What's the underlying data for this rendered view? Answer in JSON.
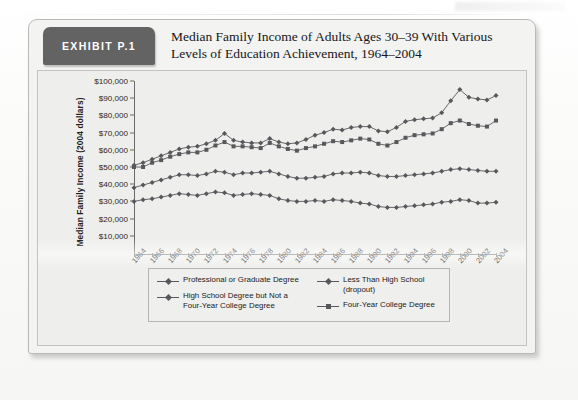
{
  "exhibit": {
    "tag": "EXHIBIT P.1",
    "title_line1": "Median Family Income of Adults Ages 30–39 With Various",
    "title_line2": "Levels of Education Achievement, 1964–2004"
  },
  "chart_data": {
    "type": "line",
    "title": "Median Family Income of Adults Ages 30–39 With Various Levels of Education Achievement, 1964–2004",
    "xlabel": "Year",
    "ylabel": "Median Family Income (2004 dollars)",
    "grid": false,
    "legend_position": "bottom",
    "ylim": [
      0,
      100000
    ],
    "yticks": [
      "$10,000",
      "$20,000",
      "$30,000",
      "$40,000",
      "$50,000",
      "$60,000",
      "$70,000",
      "$80,000",
      "$90,000",
      "$100,000"
    ],
    "ytick_values": [
      10000,
      20000,
      30000,
      40000,
      50000,
      60000,
      70000,
      80000,
      90000,
      100000
    ],
    "xlim": [
      1964,
      2004
    ],
    "xticks": [
      "1964",
      "1966",
      "1968",
      "1970",
      "1972",
      "1974",
      "1976",
      "1978",
      "1980",
      "1982",
      "1984",
      "1986",
      "1988",
      "1990",
      "1992",
      "1994",
      "1996",
      "1998",
      "2000",
      "2002",
      "2004"
    ],
    "x": [
      1964,
      1965,
      1966,
      1967,
      1968,
      1969,
      1970,
      1971,
      1972,
      1973,
      1974,
      1975,
      1976,
      1977,
      1978,
      1979,
      1980,
      1981,
      1982,
      1983,
      1984,
      1985,
      1986,
      1987,
      1988,
      1989,
      1990,
      1991,
      1992,
      1993,
      1994,
      1995,
      1996,
      1997,
      1998,
      1999,
      2000,
      2001,
      2002,
      2003,
      2004
    ],
    "series": [
      {
        "name": "Professional or Graduate Degree",
        "marker": "diamond",
        "color": "#58585c",
        "values": [
          51000,
          52500,
          54500,
          56500,
          58500,
          60500,
          61500,
          62000,
          63500,
          65500,
          69500,
          65500,
          64500,
          64000,
          64000,
          66500,
          64500,
          63500,
          64000,
          66000,
          68500,
          70000,
          72000,
          71500,
          73000,
          73500,
          73500,
          71000,
          70500,
          73000,
          76500,
          77500,
          78000,
          78500,
          81500,
          88500,
          95000,
          90500,
          89500,
          89000,
          91500
        ]
      },
      {
        "name": "Less Than High School (dropout)",
        "marker": "diamond",
        "color": "#58585c",
        "values": [
          30000,
          31000,
          31500,
          32500,
          33500,
          34500,
          34000,
          33500,
          34500,
          35500,
          35000,
          33500,
          34000,
          34500,
          34000,
          33500,
          31500,
          30500,
          30000,
          30000,
          30500,
          30000,
          31000,
          30500,
          30000,
          29000,
          28500,
          27000,
          26500,
          26500,
          27000,
          27500,
          28000,
          28500,
          29500,
          30000,
          31000,
          30500,
          29000,
          29000,
          29500
        ]
      },
      {
        "name": "High School Degree but Not a Four-Year College Degree",
        "marker": "diamond",
        "color": "#58585c",
        "values": [
          38000,
          39500,
          41000,
          42500,
          44000,
          45500,
          45500,
          45000,
          46000,
          47500,
          47000,
          45500,
          46500,
          46500,
          47000,
          47500,
          46000,
          44500,
          43500,
          43500,
          44000,
          44500,
          46000,
          46500,
          46500,
          47000,
          46500,
          45000,
          44500,
          44500,
          45000,
          45500,
          46000,
          46500,
          47500,
          48500,
          49000,
          48500,
          48000,
          47500,
          47500
        ]
      },
      {
        "name": "Four-Year College Degree",
        "marker": "square",
        "color": "#58585c",
        "values": [
          50000,
          50000,
          52500,
          54000,
          56000,
          57500,
          58500,
          58500,
          60000,
          62500,
          64500,
          62000,
          62000,
          61500,
          61000,
          64000,
          62000,
          60500,
          59500,
          61000,
          62000,
          63500,
          65000,
          64500,
          65500,
          66500,
          66000,
          63500,
          62500,
          64500,
          67000,
          68500,
          69000,
          69500,
          72000,
          75500,
          77000,
          75000,
          74000,
          73500,
          77000
        ]
      }
    ]
  },
  "legend": {
    "items": [
      {
        "label": "Professional or Graduate Degree",
        "marker": "diamond"
      },
      {
        "label": "High School Degree but Not a",
        "label2": "Four-Year College Degree",
        "marker": "diamond"
      },
      {
        "label": "Less Than High School (dropout)",
        "marker": "diamond"
      },
      {
        "label": "Four-Year College Degree",
        "marker": "square"
      }
    ]
  }
}
